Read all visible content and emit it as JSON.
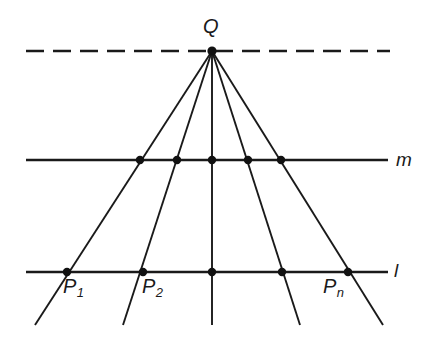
{
  "figure": {
    "background_color": "#ffffff",
    "stroke_color": "#1a1a1a",
    "dot_color": "#111111",
    "labels": {
      "vertex": "Q",
      "line_m": "m",
      "line_l": "l",
      "point_1_base": "P",
      "point_1_sub": "1",
      "point_2_base": "P",
      "point_2_sub": "2",
      "point_n_base": "P",
      "point_n_sub": "n"
    }
  },
  "chart_data": {
    "type": "diagram",
    "canvas": {
      "width": 441,
      "height": 345
    },
    "vertex": {
      "name": "Q",
      "x": 212,
      "y": 51
    },
    "lines": [
      {
        "name": "dashed-line-through-Q",
        "style": "dashed",
        "y": 51,
        "x_start": 26,
        "x_end": 390,
        "dash_length": 18,
        "gap_length": 9,
        "label": ""
      },
      {
        "name": "line-m",
        "style": "solid",
        "y": 160,
        "x_start": 26,
        "x_end": 388,
        "label": "m"
      },
      {
        "name": "line-l",
        "style": "solid",
        "y": 272,
        "x_start": 26,
        "x_end": 388,
        "label": "l"
      }
    ],
    "rays": [
      {
        "name": "ray-1",
        "from": [
          212,
          51
        ],
        "through_m": [
          140,
          160
        ],
        "through_l": [
          67,
          272
        ],
        "end": [
          35,
          325
        ]
      },
      {
        "name": "ray-2",
        "from": [
          212,
          51
        ],
        "through_m": [
          177,
          160
        ],
        "through_l": [
          143,
          272
        ],
        "end": [
          123,
          325
        ]
      },
      {
        "name": "ray-3",
        "from": [
          212,
          51
        ],
        "through_m": [
          212,
          160
        ],
        "through_l": [
          212,
          272
        ],
        "end": [
          212,
          325
        ]
      },
      {
        "name": "ray-4",
        "from": [
          212,
          51
        ],
        "through_m": [
          248,
          160
        ],
        "through_l": [
          282,
          272
        ],
        "end": [
          300,
          325
        ]
      },
      {
        "name": "ray-5",
        "from": [
          212,
          51
        ],
        "through_m": [
          281,
          160
        ],
        "through_l": [
          348,
          272
        ],
        "end": [
          383,
          325
        ]
      }
    ],
    "points_on_m": [
      {
        "x": 140,
        "y": 160,
        "label": ""
      },
      {
        "x": 177,
        "y": 160,
        "label": ""
      },
      {
        "x": 212,
        "y": 160,
        "label": ""
      },
      {
        "x": 248,
        "y": 160,
        "label": ""
      },
      {
        "x": 281,
        "y": 160,
        "label": ""
      }
    ],
    "points_on_l": [
      {
        "x": 67,
        "y": 272,
        "label": "P1"
      },
      {
        "x": 143,
        "y": 272,
        "label": "P2"
      },
      {
        "x": 212,
        "y": 272,
        "label": ""
      },
      {
        "x": 282,
        "y": 272,
        "label": ""
      },
      {
        "x": 348,
        "y": 272,
        "label": "Pn"
      }
    ],
    "dot_radius": 4.2,
    "line_width": 1.9
  }
}
